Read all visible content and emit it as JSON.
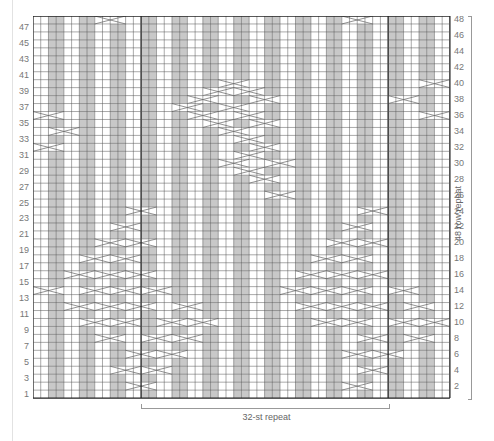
{
  "chart": {
    "stitches": 54,
    "rows": 48,
    "cell_w": 7.72,
    "cell_h": 7.96,
    "repeat_start_col": 14,
    "repeat_end_col": 46,
    "colors": {
      "knit": "#ffffff",
      "purl": "#c8c8c8",
      "grid": "#555555",
      "thick": "#222222",
      "cable": "#ffffff",
      "cable_line": "#777777"
    },
    "purl_rule": "col mod 4 in {2,3}",
    "left_labels": [
      "1",
      "3",
      "5",
      "7",
      "9",
      "11",
      "13",
      "15",
      "17",
      "19",
      "21",
      "23",
      "25",
      "27",
      "29",
      "31",
      "33",
      "35",
      "37",
      "39",
      "41",
      "43",
      "45",
      "47"
    ],
    "right_labels": [
      "2",
      "4",
      "6",
      "8",
      "10",
      "12",
      "14",
      "16",
      "18",
      "20",
      "22",
      "24",
      "26",
      "28",
      "30",
      "32",
      "34",
      "36",
      "38",
      "40",
      "42",
      "44",
      "46",
      "48"
    ],
    "stitch_repeat_label": "32-st repeat",
    "row_repeat_label": "48 row repeat",
    "cables": [
      {
        "row": 48,
        "col": 8,
        "span": 4
      },
      {
        "row": 48,
        "col": 40,
        "span": 4
      },
      {
        "row": 40,
        "col": 24,
        "span": 4
      },
      {
        "row": 40,
        "col": 50,
        "span": 4
      },
      {
        "row": 39,
        "col": 22,
        "span": 4
      },
      {
        "row": 39,
        "col": 26,
        "span": 4
      },
      {
        "row": 38,
        "col": 20,
        "span": 4
      },
      {
        "row": 38,
        "col": 28,
        "span": 4
      },
      {
        "row": 38,
        "col": 46,
        "span": 4
      },
      {
        "row": 37,
        "col": 18,
        "span": 4
      },
      {
        "row": 37,
        "col": 24,
        "span": 4
      },
      {
        "row": 36,
        "col": 0,
        "span": 4
      },
      {
        "row": 36,
        "col": 20,
        "span": 4
      },
      {
        "row": 36,
        "col": 26,
        "span": 4
      },
      {
        "row": 36,
        "col": 50,
        "span": 4
      },
      {
        "row": 35,
        "col": 22,
        "span": 4
      },
      {
        "row": 35,
        "col": 28,
        "span": 4
      },
      {
        "row": 34,
        "col": 2,
        "span": 4
      },
      {
        "row": 34,
        "col": 24,
        "span": 4
      },
      {
        "row": 33,
        "col": 26,
        "span": 4
      },
      {
        "row": 32,
        "col": 0,
        "span": 4
      },
      {
        "row": 32,
        "col": 28,
        "span": 4
      },
      {
        "row": 31,
        "col": 26,
        "span": 4
      },
      {
        "row": 30,
        "col": 24,
        "span": 4
      },
      {
        "row": 30,
        "col": 30,
        "span": 4
      },
      {
        "row": 29,
        "col": 26,
        "span": 4
      },
      {
        "row": 28,
        "col": 28,
        "span": 4
      },
      {
        "row": 26,
        "col": 30,
        "span": 4
      },
      {
        "row": 24,
        "col": 12,
        "span": 4
      },
      {
        "row": 24,
        "col": 42,
        "span": 4
      },
      {
        "row": 22,
        "col": 10,
        "span": 4
      },
      {
        "row": 22,
        "col": 40,
        "span": 4
      },
      {
        "row": 20,
        "col": 8,
        "span": 4
      },
      {
        "row": 20,
        "col": 12,
        "span": 4
      },
      {
        "row": 20,
        "col": 38,
        "span": 4
      },
      {
        "row": 20,
        "col": 42,
        "span": 4
      },
      {
        "row": 18,
        "col": 6,
        "span": 4
      },
      {
        "row": 18,
        "col": 10,
        "span": 4
      },
      {
        "row": 18,
        "col": 36,
        "span": 4
      },
      {
        "row": 18,
        "col": 40,
        "span": 4
      },
      {
        "row": 16,
        "col": 4,
        "span": 4
      },
      {
        "row": 16,
        "col": 8,
        "span": 4
      },
      {
        "row": 16,
        "col": 12,
        "span": 4
      },
      {
        "row": 16,
        "col": 34,
        "span": 4
      },
      {
        "row": 16,
        "col": 38,
        "span": 4
      },
      {
        "row": 16,
        "col": 42,
        "span": 4
      },
      {
        "row": 14,
        "col": 0,
        "span": 4
      },
      {
        "row": 14,
        "col": 6,
        "span": 4
      },
      {
        "row": 14,
        "col": 10,
        "span": 4
      },
      {
        "row": 14,
        "col": 14,
        "span": 4
      },
      {
        "row": 14,
        "col": 32,
        "span": 4
      },
      {
        "row": 14,
        "col": 36,
        "span": 4
      },
      {
        "row": 14,
        "col": 40,
        "span": 4
      },
      {
        "row": 14,
        "col": 46,
        "span": 4
      },
      {
        "row": 12,
        "col": 4,
        "span": 4
      },
      {
        "row": 12,
        "col": 8,
        "span": 4
      },
      {
        "row": 12,
        "col": 12,
        "span": 4
      },
      {
        "row": 12,
        "col": 18,
        "span": 4
      },
      {
        "row": 12,
        "col": 34,
        "span": 4
      },
      {
        "row": 12,
        "col": 38,
        "span": 4
      },
      {
        "row": 12,
        "col": 42,
        "span": 4
      },
      {
        "row": 12,
        "col": 48,
        "span": 4
      },
      {
        "row": 10,
        "col": 6,
        "span": 4
      },
      {
        "row": 10,
        "col": 10,
        "span": 4
      },
      {
        "row": 10,
        "col": 16,
        "span": 4
      },
      {
        "row": 10,
        "col": 20,
        "span": 4
      },
      {
        "row": 10,
        "col": 36,
        "span": 4
      },
      {
        "row": 10,
        "col": 40,
        "span": 4
      },
      {
        "row": 10,
        "col": 46,
        "span": 4
      },
      {
        "row": 10,
        "col": 50,
        "span": 4
      },
      {
        "row": 8,
        "col": 8,
        "span": 4
      },
      {
        "row": 8,
        "col": 14,
        "span": 4
      },
      {
        "row": 8,
        "col": 18,
        "span": 4
      },
      {
        "row": 8,
        "col": 42,
        "span": 4
      },
      {
        "row": 8,
        "col": 48,
        "span": 4
      },
      {
        "row": 6,
        "col": 12,
        "span": 4
      },
      {
        "row": 6,
        "col": 16,
        "span": 4
      },
      {
        "row": 6,
        "col": 40,
        "span": 4
      },
      {
        "row": 6,
        "col": 44,
        "span": 4
      },
      {
        "row": 4,
        "col": 10,
        "span": 4
      },
      {
        "row": 4,
        "col": 14,
        "span": 4
      },
      {
        "row": 4,
        "col": 42,
        "span": 4
      },
      {
        "row": 2,
        "col": 12,
        "span": 4
      },
      {
        "row": 2,
        "col": 40,
        "span": 4
      }
    ]
  }
}
